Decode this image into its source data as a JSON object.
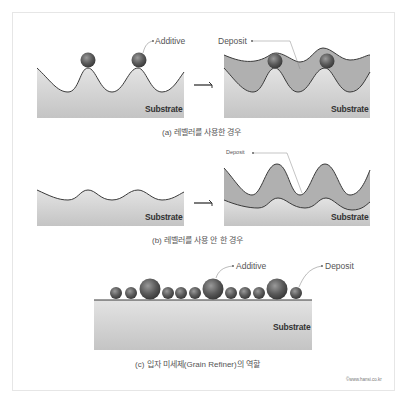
{
  "figure": {
    "panel_a": {
      "caption": "(a) 레벨러를 사용한 경우",
      "labels": {
        "additive": "Additive",
        "deposit": "Deposit",
        "substrate_left": "Substrate",
        "substrate_right": "Substrate"
      }
    },
    "panel_b": {
      "caption": "(b) 레벨러를 사용 안 한 경우",
      "labels": {
        "deposit": "Deposit",
        "substrate_left": "Substrate",
        "substrate_right": "Substrate"
      }
    },
    "panel_c": {
      "caption": "(c) 입자 미세제(Grain Refiner)의 역할",
      "labels": {
        "additive": "Additive",
        "deposit": "Deposit",
        "substrate": "Substrate"
      }
    },
    "copyright": "©www.hansi.co.kr",
    "colors": {
      "substrate": "#cfcfcf",
      "deposit": "#a9a9a9",
      "outline": "#3a3a3a",
      "sphere": "#6a6a6a"
    }
  }
}
